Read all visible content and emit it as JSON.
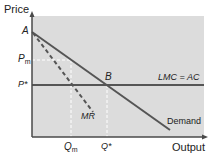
{
  "diagram": {
    "type": "economics-price-output",
    "colors": {
      "plot_background": "#dcdcdc",
      "axis": "#4a4a4a",
      "demand": "#555555",
      "lmc_ac": "#555555",
      "mr": "#555555",
      "guide_lines": "#ffffff"
    },
    "axes": {
      "y_label": "Price",
      "x_label": "Output"
    },
    "points": {
      "a": "A",
      "b": "B"
    },
    "price_levels": {
      "pm_main": "P",
      "pm_sub": "m",
      "pstar": "P*"
    },
    "quantity_levels": {
      "qm_main": "Q",
      "qm_sub": "m",
      "qstar": "Q*"
    },
    "curves": {
      "demand": "Demand",
      "mr": "MR",
      "lmc_ac": "LMC = AC"
    }
  }
}
